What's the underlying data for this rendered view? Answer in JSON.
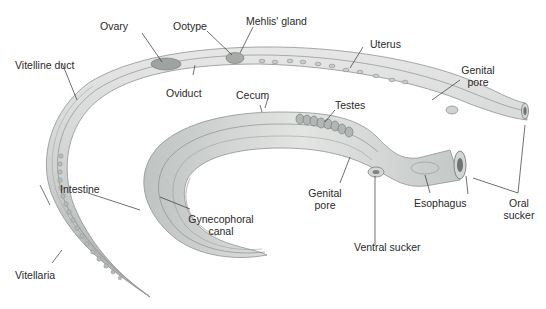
{
  "figure": {
    "colors": {
      "background": "#ffffff",
      "body_fill": "#d4d6d4",
      "body_shadow": "#a9adab",
      "internal_lines": "#7f8482",
      "organ_fill": "#9ea39f",
      "leader_line": "#333333",
      "label_text": "#2a2a2a"
    }
  },
  "labels": {
    "ovary": "Ovary",
    "ootype": "Ootype",
    "mehlis_gland": "Mehlis' gland",
    "uterus": "Uterus",
    "vitelline_duct": "Vitelline duct",
    "oviduct": "Oviduct",
    "cecum": "Cecum",
    "genital_pore_female_1": "Genital",
    "genital_pore_female_2": "pore",
    "testes": "Testes",
    "intestine": "Intestine",
    "gynecophoral_canal_1": "Gynecophoral",
    "gynecophoral_canal_2": "canal",
    "genital_pore_male_1": "Genital",
    "genital_pore_male_2": "pore",
    "esophagus": "Esophagus",
    "oral_sucker_1": "Oral",
    "oral_sucker_2": "sucker",
    "ventral_sucker": "Ventral sucker",
    "vitellaria": "Vitellaria"
  }
}
